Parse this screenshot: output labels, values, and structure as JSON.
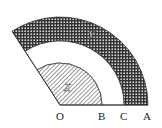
{
  "diagram": {
    "type": "concentric-sectors",
    "points": {
      "O": "O",
      "B": "B",
      "C": "C",
      "A": "A"
    },
    "regions": {
      "inner_sector": "X",
      "outer_ring": "Y"
    },
    "colors": {
      "stroke": "#333333",
      "background": "#ffffff"
    }
  }
}
